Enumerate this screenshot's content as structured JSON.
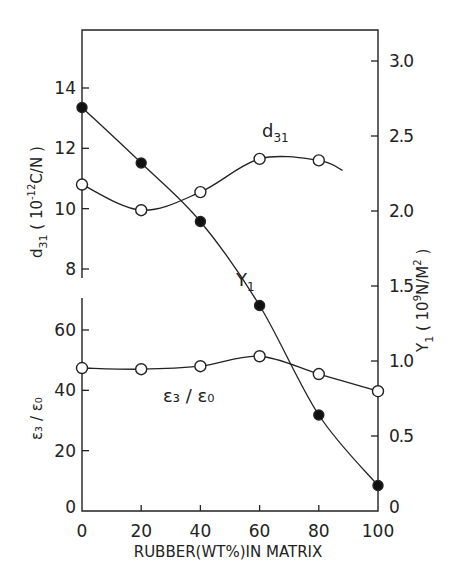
{
  "chart_data": {
    "type": "line",
    "title": "",
    "xlabel": "RUBBER(WT%)IN MATRIX",
    "x": [
      0,
      20,
      40,
      60,
      80,
      100
    ],
    "xticks": [
      "0",
      "20",
      "40",
      "60",
      "80",
      "100"
    ],
    "xlim": [
      0,
      100
    ],
    "grid": false,
    "legend_position": "inline labels",
    "axes": {
      "left_upper": {
        "label": "d31 (10^-12 C/N)",
        "label_main": "d",
        "label_sub": "31",
        "label_unit": "( 10",
        "label_exp": "-12",
        "label_tail": "C/N )",
        "ticks": [
          "8",
          "10",
          "12",
          "14"
        ],
        "ylim": [
          7.7,
          15.7
        ]
      },
      "left_lower": {
        "label": "ε3/ε0",
        "label_text": "ε₃ / ε₀",
        "ticks": [
          "0",
          "20",
          "40",
          "60"
        ],
        "ylim": [
          0,
          66
        ]
      },
      "right": {
        "label": "Y1 (10^9 N/M^2)",
        "label_main": "Y",
        "label_sub": "1",
        "label_unit": "( 10",
        "label_exp": "9",
        "label_tail": "N/M",
        "label_exp2": "2",
        "label_close": ")",
        "ticks": [
          "0",
          "0.5",
          "1.0",
          "1.5",
          "2.0",
          "2.5",
          "3.0"
        ],
        "ylim": [
          0,
          3.2
        ]
      }
    },
    "series": [
      {
        "name": "d31",
        "label_main": "d",
        "label_sub": "31",
        "axis": "left_upper",
        "marker": "open-circle",
        "values": [
          10.8,
          9.95,
          10.55,
          11.65,
          11.6
        ],
        "x": [
          0,
          20,
          40,
          60,
          80
        ],
        "curve_extends_to_x": 88
      },
      {
        "name": "Y1",
        "label_main": "Y",
        "label_sub": "1",
        "axis": "right",
        "marker": "filled-circle",
        "values": [
          2.69,
          2.32,
          1.93,
          1.37,
          0.64,
          0.17
        ],
        "x": [
          0,
          20,
          40,
          60,
          80,
          100
        ]
      },
      {
        "name": "ε3/ε0",
        "label_text": "ε₃ / ε₀",
        "axis": "left_lower",
        "marker": "open-circle",
        "values": [
          47.4,
          47.0,
          48.0,
          51.3,
          45.4,
          39.7
        ],
        "x": [
          0,
          20,
          40,
          60,
          80,
          100
        ]
      }
    ]
  }
}
